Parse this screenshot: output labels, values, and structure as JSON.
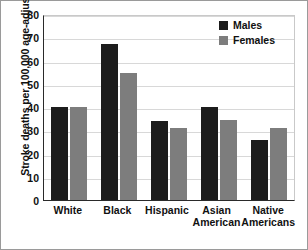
{
  "chart_data": {
    "type": "bar",
    "title": "",
    "xlabel": "",
    "ylabel": "Stroke deaths per 100,000 age-adjusted",
    "ylim": [
      0,
      80
    ],
    "yticks": [
      0,
      10,
      20,
      30,
      40,
      50,
      60,
      70,
      80
    ],
    "grid": true,
    "legend_position": "top-right",
    "categories": [
      "White",
      "Black",
      "Hispanic",
      "Asian\nAmerican",
      "Native\nAmericans"
    ],
    "series": [
      {
        "name": "Males",
        "color": "#1c1c1c",
        "values": [
          40,
          67,
          34,
          40,
          26
        ]
      },
      {
        "name": "Females",
        "color": "#7d7d7d",
        "values": [
          40,
          54.5,
          31,
          34.5,
          31
        ]
      }
    ]
  },
  "colors": {
    "male": "#1c1c1c",
    "female": "#7d7d7d",
    "axis": "#2a2a2a",
    "grid": "#d8d8d8",
    "frame": "#9a9a9a",
    "background": "#ffffff"
  }
}
